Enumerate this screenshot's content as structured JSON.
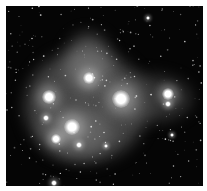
{
  "image": {
    "subject": "Pleiades star cluster (M45) with reflection nebula",
    "colors": {
      "background": "#ffffff",
      "sky": "#050505",
      "nebula": "#8a8a8a",
      "star": "#ffffff"
    },
    "frame": {
      "x": 6,
      "y": 6,
      "width": 197,
      "height": 180
    },
    "bright_stars": [
      {
        "name": "star-a",
        "x": 43,
        "y": 91,
        "r": 7
      },
      {
        "name": "star-b",
        "x": 83,
        "y": 72,
        "r": 6
      },
      {
        "name": "star-c",
        "x": 115,
        "y": 93,
        "r": 9
      },
      {
        "name": "star-d",
        "x": 162,
        "y": 88,
        "r": 6
      },
      {
        "name": "star-d2",
        "x": 162,
        "y": 98,
        "r": 3
      },
      {
        "name": "star-e",
        "x": 66,
        "y": 121,
        "r": 8
      },
      {
        "name": "star-f",
        "x": 50,
        "y": 133,
        "r": 5
      },
      {
        "name": "star-g",
        "x": 40,
        "y": 112,
        "r": 3
      },
      {
        "name": "star-h",
        "x": 73,
        "y": 139,
        "r": 3
      },
      {
        "name": "star-i",
        "x": 48,
        "y": 177,
        "r": 3
      },
      {
        "name": "star-j",
        "x": 142,
        "y": 12,
        "r": 2
      },
      {
        "name": "star-k",
        "x": 166,
        "y": 129,
        "r": 2
      },
      {
        "name": "star-l",
        "x": 100,
        "y": 140,
        "r": 2
      }
    ]
  }
}
